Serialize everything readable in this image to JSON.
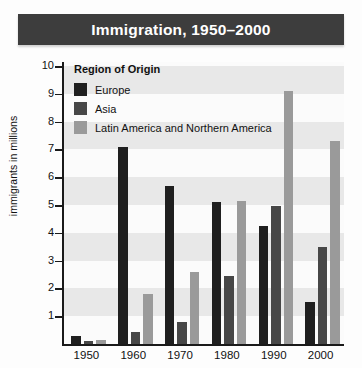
{
  "title": "Immigration, 1950–2000",
  "legend": {
    "heading": "Region of Origin",
    "items": [
      {
        "label": "Europe",
        "color": "#1f1f1f"
      },
      {
        "label": "Asia",
        "color": "#474747"
      },
      {
        "label": "Latin America and Northern America",
        "color": "#9a9a9a"
      }
    ]
  },
  "axes": {
    "ylabel": "immigrants in millions",
    "yticks": [
      "1",
      "2",
      "3",
      "4",
      "5",
      "6",
      "7",
      "8",
      "9",
      "10"
    ],
    "xticks": [
      "1950",
      "1960",
      "1970",
      "1980",
      "1990",
      "2000"
    ]
  },
  "colors": {
    "title_bar": "#3d3d3d",
    "title_text": "#ffffff",
    "band": "#e8e8e8",
    "axis": "#1a1a1a",
    "plot_bg": "#fbfbfb"
  },
  "chart_data": {
    "type": "bar",
    "title": "Immigration, 1950–2000",
    "xlabel": "",
    "ylabel": "immigrants in millions",
    "ylim": [
      0,
      10
    ],
    "categories": [
      "1950",
      "1960",
      "1970",
      "1980",
      "1990",
      "2000"
    ],
    "legend_title": "Region of Origin",
    "legend_position": "top-left inside plot",
    "grid": "horizontal alternating gray bands",
    "series": [
      {
        "name": "Europe",
        "color": "#1f1f1f",
        "values": [
          0.3,
          7.1,
          5.7,
          5.1,
          4.25,
          1.5
        ]
      },
      {
        "name": "Asia",
        "color": "#474747",
        "values": [
          0.1,
          0.45,
          0.8,
          2.45,
          4.95,
          3.5
        ]
      },
      {
        "name": "Latin America and Northern America",
        "color": "#9a9a9a",
        "values": [
          0.15,
          1.8,
          2.6,
          5.15,
          9.1,
          7.3
        ]
      }
    ]
  }
}
